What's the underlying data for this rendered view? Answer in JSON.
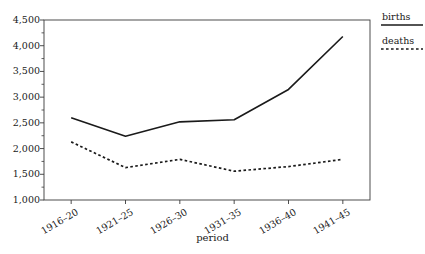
{
  "chart_data": {
    "type": "line",
    "title": "",
    "subtitle": "",
    "xlabel": "period",
    "ylabel": "",
    "categories": [
      "1916–20",
      "1921–25",
      "1926–30",
      "1931–35",
      "1936–40",
      "1941–45"
    ],
    "ylim": [
      1000,
      4500
    ],
    "ytick_labels": [
      "1,000",
      "1,500",
      "2,000",
      "2,500",
      "3,000",
      "3,500",
      "4,000",
      "4,500"
    ],
    "ytick_values": [
      1000,
      1500,
      2000,
      2500,
      3000,
      3500,
      4000,
      4500
    ],
    "ytick_minor_step": 250,
    "grid": false,
    "legend_position": "right",
    "series": [
      {
        "name": "births",
        "style": "solid",
        "color": "#1a1a1a",
        "values": [
          2600,
          2240,
          2520,
          2560,
          3150,
          4180
        ]
      },
      {
        "name": "deaths",
        "style": "dashed",
        "color": "#1a1a1a",
        "values": [
          2130,
          1630,
          1790,
          1560,
          1650,
          1790
        ]
      }
    ]
  },
  "legend": {
    "births_label": "births",
    "deaths_label": "deaths"
  },
  "axes": {
    "x_title": "period"
  }
}
